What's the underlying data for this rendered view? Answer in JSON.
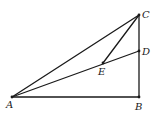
{
  "diagram": {
    "type": "geometry",
    "points": {
      "A": {
        "label": "A",
        "x": 12,
        "y": 97,
        "lx": 6,
        "ly": 108
      },
      "B": {
        "label": "B",
        "x": 139,
        "y": 97,
        "lx": 135,
        "ly": 110
      },
      "C": {
        "label": "C",
        "x": 139,
        "y": 15,
        "lx": 142,
        "ly": 18
      },
      "D": {
        "label": "D",
        "x": 139,
        "y": 51,
        "lx": 142,
        "ly": 55
      },
      "E": {
        "label": "E",
        "x": 103,
        "y": 63,
        "lx": 98,
        "ly": 75
      }
    },
    "segments": [
      [
        "A",
        "B"
      ],
      [
        "B",
        "C"
      ],
      [
        "A",
        "C"
      ],
      [
        "A",
        "D"
      ],
      [
        "E",
        "C"
      ]
    ],
    "colors": {
      "stroke": "#1a1a1a",
      "background": "#ffffff"
    }
  }
}
